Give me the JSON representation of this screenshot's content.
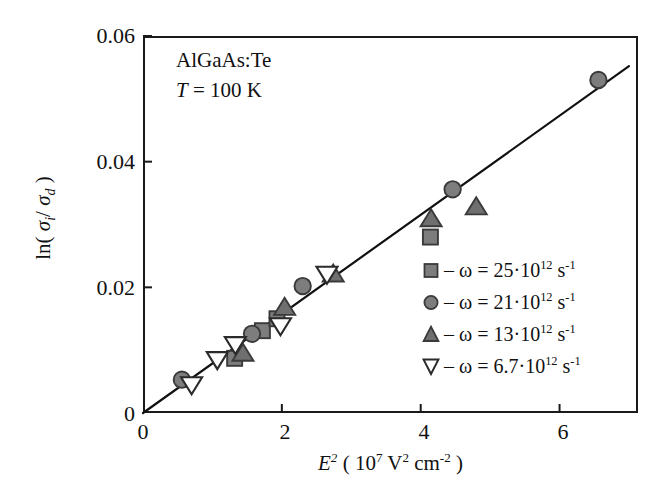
{
  "chart_data": {
    "type": "scatter",
    "title": "",
    "xlabel_plain": "E^2 ( 10^7 V^2 cm^-2 )",
    "ylabel_plain": "ln ( sigma_i / sigma_d )",
    "xlim": [
      0,
      7.13
    ],
    "ylim": [
      0,
      0.06
    ],
    "xticks": [
      "0",
      "2",
      "4",
      "6"
    ],
    "xtick_values": [
      0,
      2,
      4,
      6
    ],
    "yticks": [
      "0",
      "0.02",
      "0.04",
      "0.06"
    ],
    "ytick_values": [
      0,
      0.02,
      0.04,
      0.06
    ],
    "grid": false,
    "legend_position": "inside-lower-right",
    "annotations": [
      {
        "text": "AlGaAs:Te"
      },
      {
        "text": "T = 100 K"
      }
    ],
    "fit_line": {
      "label": "linear fit through origin",
      "x": [
        0.0,
        7.0
      ],
      "y": [
        0.0,
        0.0552
      ],
      "slope": 0.00789,
      "intercept": 0.0
    },
    "series": [
      {
        "name": "omega = 25e12 s^-1",
        "marker": "square",
        "marker_fill": "#7d7d7d",
        "marker_edge": "#3a3a3a",
        "points": [
          {
            "x": 1.32,
            "y": 0.0087
          },
          {
            "x": 1.72,
            "y": 0.0131
          },
          {
            "x": 1.93,
            "y": 0.015
          },
          {
            "x": 4.14,
            "y": 0.028
          }
        ]
      },
      {
        "name": "omega = 21e12 s^-1",
        "marker": "circle",
        "marker_fill": "#7d7d7d",
        "marker_edge": "#3a3a3a",
        "points": [
          {
            "x": 0.56,
            "y": 0.0053
          },
          {
            "x": 1.57,
            "y": 0.0126
          },
          {
            "x": 2.3,
            "y": 0.0202
          },
          {
            "x": 4.46,
            "y": 0.0356
          },
          {
            "x": 6.56,
            "y": 0.053
          }
        ]
      },
      {
        "name": "omega = 13e12 s^-1",
        "marker": "triangle-up",
        "marker_fill": "#6f6f6f",
        "marker_edge": "#3a3a3a",
        "points": [
          {
            "x": 1.44,
            "y": 0.0094
          },
          {
            "x": 2.04,
            "y": 0.0167
          },
          {
            "x": 2.74,
            "y": 0.022
          },
          {
            "x": 4.15,
            "y": 0.0308
          },
          {
            "x": 4.8,
            "y": 0.0327
          }
        ]
      },
      {
        "name": "omega = 6.7e12 s^-1",
        "marker": "triangle-down",
        "marker_fill": "#ffffff",
        "marker_edge": "#2b2b2b",
        "points": [
          {
            "x": 0.7,
            "y": 0.0046
          },
          {
            "x": 1.07,
            "y": 0.0086
          },
          {
            "x": 1.33,
            "y": 0.011
          },
          {
            "x": 1.98,
            "y": 0.014
          },
          {
            "x": 2.65,
            "y": 0.0222
          }
        ]
      }
    ]
  },
  "axes": {
    "x_title": {
      "symbol": "E",
      "symbol_exp": "2",
      "open_paren": "(",
      "factor_base": "10",
      "factor_exp": "7",
      "unit1": "V",
      "unit1_exp": "2",
      "unit2": "cm",
      "unit2_exp": "-2",
      "close_paren": ")"
    },
    "y_title": {
      "func": "ln",
      "open_paren": "(",
      "sigma1": "σ",
      "sigma1_sub": "i",
      "slash": "/",
      "sigma2": "σ",
      "sigma2_sub": "d",
      "close_paren": ")"
    },
    "xticks": [
      "0",
      "2",
      "4",
      "6"
    ],
    "yticks": [
      "0.06",
      "0.04",
      "0.02",
      "0"
    ]
  },
  "annotations": {
    "material": "AlGaAs:Te",
    "temperature_symbol": "T",
    "temperature_value": " = 100 K"
  },
  "legend": {
    "entries": [
      {
        "icon": "filled-square-marker-icon",
        "dash": "–",
        "omega": "ω",
        "equals": " = ",
        "mantissa": "25",
        "dot": "·",
        "base": "10",
        "exponent": "12",
        "unit": "s",
        "unit_exponent": "-1"
      },
      {
        "icon": "filled-circle-marker-icon",
        "dash": "–",
        "omega": "ω",
        "equals": " = ",
        "mantissa": "21",
        "dot": "·",
        "base": "10",
        "exponent": "12",
        "unit": "s",
        "unit_exponent": "-1"
      },
      {
        "icon": "filled-triangle-up-marker-icon",
        "dash": "–",
        "omega": "ω",
        "equals": " = ",
        "mantissa": "13",
        "dot": "·",
        "base": "10",
        "exponent": "12",
        "unit": "s",
        "unit_exponent": "-1"
      },
      {
        "icon": "open-triangle-down-marker-icon",
        "dash": "–",
        "omega": "ω",
        "equals": " = ",
        "mantissa": "6.7",
        "dot": "·",
        "base": "10",
        "exponent": "12",
        "unit": "s",
        "unit_exponent": "-1"
      }
    ]
  },
  "colors": {
    "axis": "#1a1a1a",
    "marker_fill_gray": "#7d7d7d",
    "marker_edge": "#3a3a3a",
    "open_marker_fill": "#ffffff",
    "line": "#111111",
    "text": "#111111",
    "background": "#ffffff"
  }
}
